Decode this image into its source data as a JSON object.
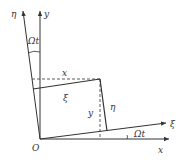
{
  "diagram": {
    "labels": {
      "eta_axis": "η",
      "y_axis": "y",
      "x_axis": "x",
      "xi_axis": "ξ",
      "origin": "O",
      "angle_top": "Ωt",
      "angle_bottom": "Ωt",
      "x_proj": "x",
      "y_proj": "y",
      "xi_proj": "ξ",
      "eta_proj": "η"
    },
    "colors": {
      "line": "#333333",
      "background": "#ffffff"
    }
  }
}
